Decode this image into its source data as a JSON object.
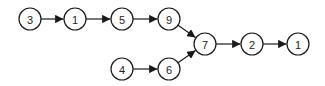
{
  "diagram": {
    "type": "directed-graph",
    "node_radius": 11,
    "stroke_color": "#1a1a1a",
    "nodes": [
      {
        "id": "n3a",
        "label": "3",
        "x": 30,
        "y": 19
      },
      {
        "id": "n1a",
        "label": "1",
        "x": 75,
        "y": 19
      },
      {
        "id": "n5",
        "label": "5",
        "x": 122,
        "y": 19
      },
      {
        "id": "n9",
        "label": "9",
        "x": 169,
        "y": 19
      },
      {
        "id": "n4",
        "label": "4",
        "x": 122,
        "y": 69
      },
      {
        "id": "n6",
        "label": "6",
        "x": 169,
        "y": 69
      },
      {
        "id": "n7",
        "label": "7",
        "x": 205,
        "y": 44
      },
      {
        "id": "n2",
        "label": "2",
        "x": 252,
        "y": 44
      },
      {
        "id": "n1b",
        "label": "1",
        "x": 298,
        "y": 44
      }
    ],
    "edges": [
      {
        "from": "n3a",
        "to": "n1a"
      },
      {
        "from": "n1a",
        "to": "n5"
      },
      {
        "from": "n5",
        "to": "n9"
      },
      {
        "from": "n9",
        "to": "n7"
      },
      {
        "from": "n4",
        "to": "n6"
      },
      {
        "from": "n6",
        "to": "n7"
      },
      {
        "from": "n7",
        "to": "n2"
      },
      {
        "from": "n2",
        "to": "n1b"
      }
    ]
  }
}
